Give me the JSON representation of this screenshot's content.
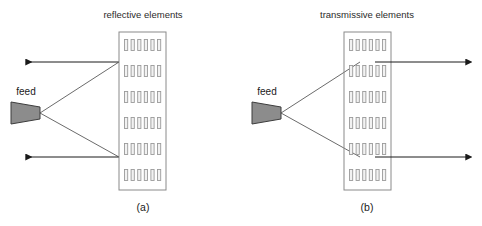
{
  "figure": {
    "background_color": "#ffffff",
    "width": 482,
    "height": 226
  },
  "style": {
    "panel_border_color": "#8a8a8a",
    "element_border_color": "#9a9a9a",
    "element_fill_color": "#f2f2f2",
    "ray_color": "#6b6b6b",
    "arrow_color": "#1a1a1a",
    "feed_fill_color": "#8c8c8c",
    "feed_border_color": "#3d3d3d",
    "text_color": "#1a1a1a"
  },
  "panels": [
    {
      "id": "reflectarray",
      "title": "reflective elements",
      "caption": "(a)",
      "feed_label": "feed",
      "mode": "reflective",
      "array": {
        "rows": 6,
        "columns": 6,
        "element_width": 3.2,
        "element_height": 11,
        "col_gap": 3.4,
        "row_gap": 14.5
      },
      "geometry": {
        "panel_x": 119,
        "panel_y": 32,
        "panel_width": 47,
        "panel_height": 158,
        "feed_apex_x": 40,
        "feed_apex_y": 113,
        "feed_back_x": 11,
        "feed_half_back": 11,
        "feed_half_front": 6,
        "ray_top_y": 62,
        "ray_bottom_y": 157,
        "beam_end_x": 26,
        "title_x": 143,
        "title_y": 18,
        "caption_x": 143,
        "caption_y": 211,
        "feed_label_x": 26,
        "feed_label_y": 95
      }
    },
    {
      "id": "transmitarray",
      "title": "transmissive elements",
      "caption": "(b)",
      "feed_label": "feed",
      "mode": "transmissive",
      "array": {
        "rows": 6,
        "columns": 6,
        "element_width": 3.2,
        "element_height": 11,
        "col_gap": 3.4,
        "row_gap": 14.5
      },
      "geometry": {
        "panel_x": 344,
        "panel_y": 32,
        "panel_width": 47,
        "panel_height": 158,
        "feed_apex_x": 281,
        "feed_apex_y": 113,
        "feed_back_x": 252,
        "feed_half_back": 11,
        "feed_half_front": 6,
        "ray_top_y": 62,
        "ray_bottom_y": 157,
        "ray_hit_x": 360,
        "beam_end_x": 466,
        "title_x": 367,
        "title_y": 18,
        "caption_x": 367,
        "caption_y": 211,
        "feed_label_x": 267,
        "feed_label_y": 95
      }
    }
  ]
}
